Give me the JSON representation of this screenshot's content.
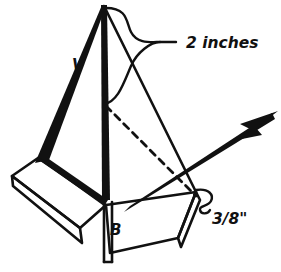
{
  "figure": {
    "style": "hand-inked line art, black on white",
    "ink_color": "#111111",
    "background_color": "#ffffff",
    "annotations": {
      "dimension_height": "2 inches",
      "dimension_thickness": "3/8\"",
      "label_v": "V",
      "label_b": "B"
    },
    "icons": {
      "arrow": "arrow-pointing-up-right",
      "brace_large": "curly-brace-large",
      "brace_small": "curly-brace-small",
      "dashed_edge": "hidden-edge-dashed"
    }
  }
}
